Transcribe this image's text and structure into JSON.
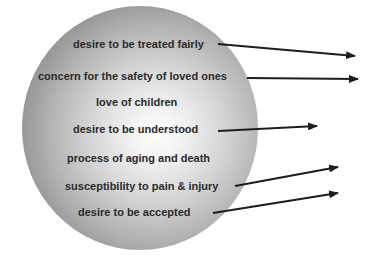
{
  "diagram": {
    "type": "sphere-with-arrows",
    "labels": [
      {
        "text": "desire to be treated fairly",
        "has_arrow": true
      },
      {
        "text": "concern for the safety of loved ones",
        "has_arrow": true
      },
      {
        "text": "love of children",
        "has_arrow": false
      },
      {
        "text": "desire to be understood",
        "has_arrow": true
      },
      {
        "text": "process of aging and death",
        "has_arrow": false
      },
      {
        "text": "susceptibility to pain & injury",
        "has_arrow": true
      },
      {
        "text": "desire to be accepted",
        "has_arrow": true
      }
    ],
    "colors": {
      "text": "#2b2b2b",
      "arrow": "#1e1e1e",
      "sphere_highlight": "#ffffff",
      "sphere_edge": "#8e8e8e"
    }
  }
}
